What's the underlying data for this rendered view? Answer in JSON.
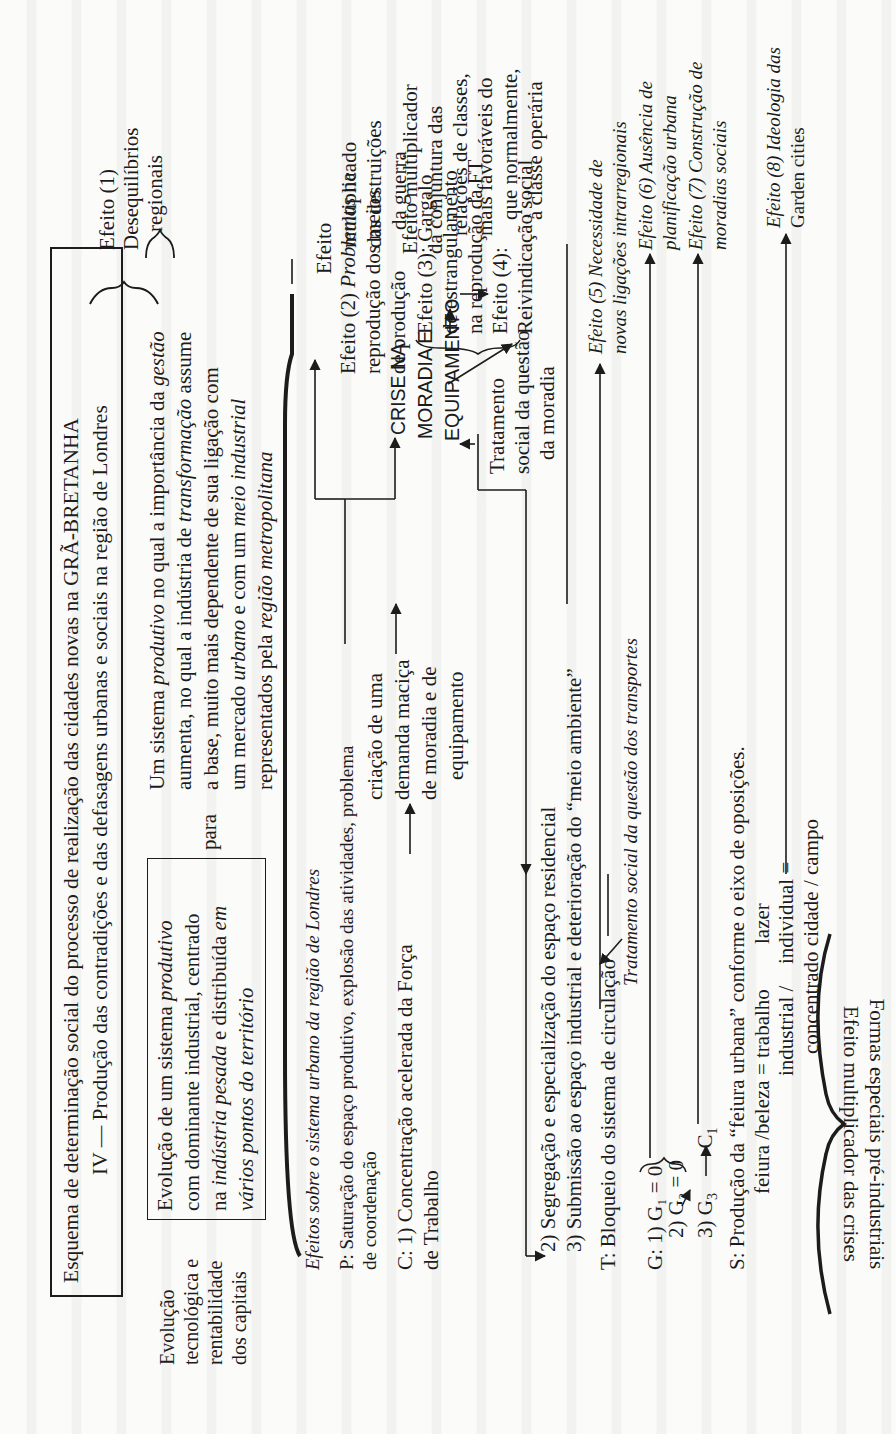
{
  "title_box": {
    "line1": "Esquema de determinação social do processo de realização das cidades novas na GRÃ-BRETANHA",
    "line2": "IV — Produção das contradições e das defasagens  urbanas e sociais na região de Londres"
  },
  "left_label": {
    "lines": [
      "Evolução",
      "tecnológica e",
      "rentabilidade",
      "dos capitais"
    ]
  },
  "evolution_box": {
    "lines": [
      [
        "Evolução de um sistema ",
        {
          "i": "produtivo"
        }
      ],
      [
        "com dominante industrial, centrado"
      ],
      [
        "na ",
        {
          "i": "indústria pesada"
        },
        " e distribuída ",
        {
          "i": "em"
        }
      ],
      [
        {
          "i": "vários pontos do território"
        }
      ]
    ]
  },
  "para_label": "para",
  "system_block": {
    "lines": [
      [
        "Um sistema ",
        {
          "i": "produtivo"
        },
        " no qual a importância da ",
        {
          "i": "gestão"
        }
      ],
      [
        "aumenta, no qual a indústria de ",
        {
          "i": "transformação"
        },
        " assume"
      ],
      [
        "a base, muito mais dependente de sua ligação com"
      ],
      [
        "um mercado ",
        {
          "i": "urbano"
        },
        " e com um ",
        {
          "i": "meio industrial"
        }
      ],
      [
        "representados pela ",
        {
          "i": "região metropolitana"
        }
      ]
    ]
  },
  "effect1": {
    "lines": [
      "Efeito (1)",
      "Desequilíbrios",
      "regionais"
    ]
  },
  "effects_heading": [
    "Efeitos ",
    {
      "i": "sobre o sistema urbano da região de Londres"
    }
  ],
  "P": {
    "line1": "P: Saturação do espaço produtivo, explosão das atividades, problema",
    "line2": "de coordenação"
  },
  "C": {
    "line1": "C: 1) Concentração acelerada da Força",
    "line2": "de Trabalho",
    "demand": [
      "criação de uma",
      "demanda maciça",
      "de moradia e de",
      "equipamento"
    ]
  },
  "crisis": {
    "lines": [
      "CRISE NA",
      "MORADIA E",
      "EQUIPAMENTO"
    ]
  },
  "treatment_housing": {
    "lines": [
      "Tratamento",
      "social da questão",
      "da moradia"
    ]
  },
  "war_effect": {
    "lines": [
      "Efeito",
      "multiplicado",
      "das destruições",
      "da guerra"
    ]
  },
  "effect2": {
    "lines": [
      [
        "Efeito (2) ",
        {
          "i": "Problemas"
        },
        " na"
      ],
      [
        "reprodução dos meios"
      ],
      [
        "de produção"
      ]
    ]
  },
  "effect3": {
    "lines": [
      "Efeito (3): Gargalo",
      "de estrangulamento",
      "na reprodução da FT"
    ]
  },
  "effect4": {
    "lines": [
      "Efeito (4):",
      "Reivindicação social"
    ]
  },
  "class_effect": {
    "lines": [
      "Efeito multiplicador",
      "da conjuntura das",
      "relações de classes,",
      "mais favoráveis do",
      "que normalmente,",
      "à classe operária"
    ]
  },
  "C2": "2) Segregação e especialização do espaço residencial",
  "C3": "3) Submissão ao espaço industrial e deterioração do “meio ambiente”",
  "T": "T: Bloqueio do sistema de circulação",
  "transport_treatment": "Tratamento social da questão dos transportes",
  "G": {
    "g1": "G: 1) G₁ = 0",
    "g2": "2) G₂ = 0",
    "g3_prefix": "3) G",
    "g3_sub": "3",
    "c1": "C",
    "c1_sub": "1"
  },
  "S": {
    "line1": "S: Produção da “feiura urbana” conforme o eixo de oposições.",
    "row_a": [
      "feiura /beleza = trabalho",
      "lazer"
    ],
    "row_b": [
      "industrial /",
      "individual ="
    ],
    "row_c": "concentrado cidade / campo"
  },
  "effects_right": [
    {
      "lines": [
        [
          "Efeito (5) ",
          "Necessidade de"
        ],
        [
          "novas ligações intrarregionais"
        ]
      ]
    },
    {
      "lines": [
        [
          "Efeito (6) ",
          "Ausência de"
        ],
        [
          "planificação urbana"
        ]
      ]
    },
    {
      "lines": [
        [
          "Efeito (7) ",
          "Construção de"
        ],
        [
          "moradias sociais"
        ]
      ]
    },
    {
      "lines": [
        [
          "Efeito (8) ",
          "Ideologia das"
        ],
        [
          "Garden cities"
        ]
      ]
    }
  ],
  "bottom_caption": {
    "line1": "Efeito multiplicador das crises",
    "line2": "Formas especiais pré-industriais"
  },
  "colors": {
    "paper": "#fbfbf9",
    "ink": "#1c1c1c"
  }
}
